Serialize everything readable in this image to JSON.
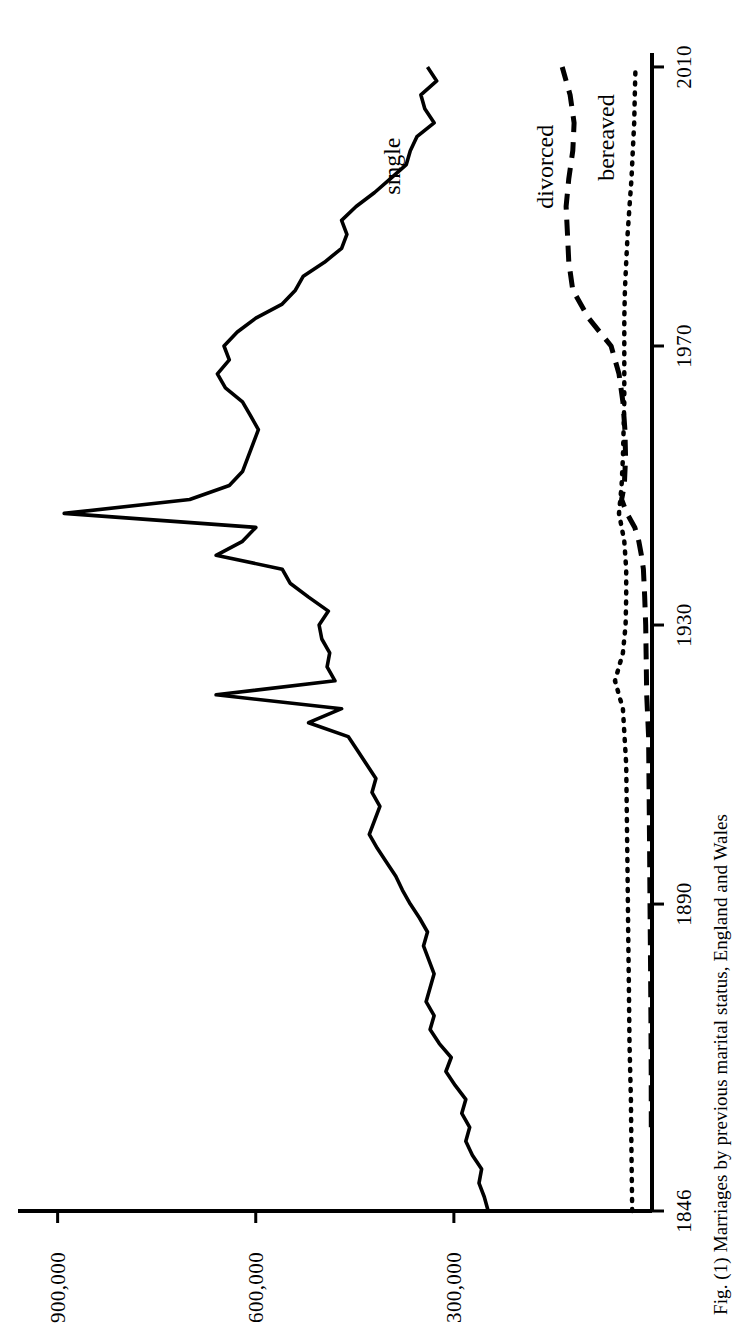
{
  "figure": {
    "caption": "Fig. (1) Marriages by previous marital status, England and Wales"
  },
  "chart_data": {
    "type": "line",
    "title": "",
    "subtitle": "",
    "xlabel": "",
    "ylabel": "",
    "xlim": [
      1846,
      2012
    ],
    "ylim": [
      0,
      960000
    ],
    "grid": false,
    "legend": "in-plot series labels",
    "orientation": "printed sideways (rotated 90 degrees counter-clockwise)",
    "x_ticks": [
      "1846",
      "1890",
      "1930",
      "1970",
      "2010"
    ],
    "x_tick_values": [
      1846,
      1890,
      1930,
      1970,
      2010
    ],
    "y_ticks": [
      "300,000",
      "600,000",
      "900,000"
    ],
    "y_tick_values": [
      300000,
      600000,
      900000
    ],
    "series": [
      {
        "name": "single",
        "label": "single",
        "style": "solid",
        "color": "#000000",
        "x": [
          1846,
          1848,
          1850,
          1852,
          1854,
          1856,
          1858,
          1860,
          1862,
          1864,
          1866,
          1868,
          1870,
          1872,
          1874,
          1876,
          1878,
          1880,
          1882,
          1884,
          1886,
          1888,
          1890,
          1892,
          1894,
          1896,
          1898,
          1900,
          1902,
          1904,
          1906,
          1908,
          1910,
          1912,
          1914,
          1916,
          1918,
          1920,
          1922,
          1924,
          1926,
          1928,
          1930,
          1932,
          1934,
          1936,
          1938,
          1940,
          1942,
          1944,
          1946,
          1948,
          1950,
          1952,
          1954,
          1956,
          1958,
          1960,
          1962,
          1964,
          1966,
          1968,
          1970,
          1972,
          1974,
          1976,
          1978,
          1980,
          1982,
          1984,
          1986,
          1988,
          1990,
          1992,
          1994,
          1996,
          1998,
          2000,
          2002,
          2004,
          2006,
          2008,
          2010
        ],
        "values": [
          248000,
          254000,
          262000,
          258000,
          272000,
          282000,
          276000,
          288000,
          282000,
          298000,
          312000,
          304000,
          322000,
          336000,
          330000,
          342000,
          336000,
          330000,
          338000,
          346000,
          340000,
          352000,
          366000,
          378000,
          388000,
          402000,
          416000,
          428000,
          420000,
          412000,
          424000,
          418000,
          432000,
          446000,
          460000,
          520000,
          470000,
          660000,
          480000,
          492000,
          488000,
          500000,
          504000,
          490000,
          520000,
          548000,
          560000,
          660000,
          620000,
          600000,
          890000,
          700000,
          640000,
          620000,
          612000,
          604000,
          596000,
          608000,
          620000,
          646000,
          658000,
          640000,
          648000,
          628000,
          600000,
          560000,
          540000,
          528000,
          496000,
          470000,
          462000,
          470000,
          448000,
          420000,
          396000,
          372000,
          366000,
          356000,
          330000,
          344000,
          350000,
          326000,
          340000
        ]
      },
      {
        "name": "divorced",
        "label": "divorced",
        "style": "dashed",
        "color": "#000000",
        "x": [
          1858,
          1866,
          1874,
          1882,
          1890,
          1898,
          1906,
          1914,
          1920,
          1926,
          1930,
          1934,
          1938,
          1940,
          1942,
          1944,
          1946,
          1948,
          1950,
          1954,
          1958,
          1962,
          1966,
          1970,
          1974,
          1978,
          1982,
          1986,
          1990,
          1994,
          1998,
          2002,
          2006,
          2010
        ],
        "values": [
          1000,
          1200,
          1600,
          2200,
          3000,
          3600,
          4400,
          5200,
          8000,
          9000,
          9500,
          11000,
          13000,
          16000,
          20000,
          26000,
          38000,
          46000,
          42000,
          40000,
          41000,
          44000,
          50000,
          62000,
          96000,
          120000,
          126000,
          128000,
          130000,
          126000,
          120000,
          118000,
          124000,
          136000
        ]
      },
      {
        "name": "bereaved",
        "label": "bereaved",
        "style": "dotted",
        "color": "#000000",
        "x": [
          1846,
          1854,
          1862,
          1870,
          1878,
          1886,
          1894,
          1902,
          1910,
          1918,
          1922,
          1926,
          1930,
          1934,
          1938,
          1942,
          1946,
          1950,
          1954,
          1958,
          1962,
          1966,
          1970,
          1974,
          1978,
          1982,
          1986,
          1990,
          1994,
          1998,
          2002,
          2006,
          2010
        ],
        "values": [
          30000,
          31000,
          32000,
          34000,
          35000,
          36000,
          37000,
          38000,
          39000,
          44000,
          56000,
          44000,
          40000,
          39000,
          39000,
          42000,
          50000,
          46000,
          44000,
          43000,
          42000,
          42000,
          42000,
          42000,
          41000,
          39000,
          37000,
          34000,
          31000,
          29000,
          27000,
          26000,
          25000
        ]
      }
    ],
    "annotations": [
      {
        "text": "single",
        "series": "single",
        "near_x": 2004
      },
      {
        "text": "divorced",
        "series": "divorced",
        "near_x": 2004
      },
      {
        "text": "bereaved",
        "series": "bereaved",
        "near_x": 2006
      }
    ]
  },
  "axes": {
    "x_tick_labels": [
      "1846",
      "1890",
      "1930",
      "1970",
      "2010"
    ],
    "y_tick_labels": [
      "300,000",
      "600,000",
      "900,000"
    ]
  }
}
